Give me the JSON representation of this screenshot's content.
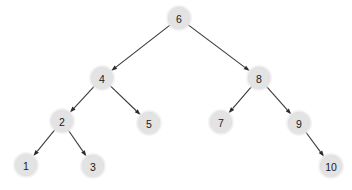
{
  "figure": {
    "type": "directed-tree-diagram",
    "width": 352,
    "height": 190,
    "background_color": "#ffffff"
  },
  "style": {
    "node_fill": "#e3e3e3",
    "node_halo": "#e8e8e8",
    "node_stroke": "#dcdcdc",
    "label_color": "#1a1a1a",
    "edge_color": "#3a3a3a",
    "arrow_color": "#2b2b2b",
    "node_radius": 11,
    "halo_radius": 13,
    "edge_width": 1.1
  },
  "nodes": [
    {
      "id": "n6",
      "label": "6",
      "x": 179,
      "y": 18,
      "level": 0
    },
    {
      "id": "n4",
      "label": "4",
      "x": 102,
      "y": 78,
      "level": 1
    },
    {
      "id": "n8",
      "label": "8",
      "x": 259,
      "y": 78,
      "level": 1
    },
    {
      "id": "n2",
      "label": "2",
      "x": 62,
      "y": 121,
      "level": 2
    },
    {
      "id": "n5",
      "label": "5",
      "x": 149,
      "y": 123,
      "level": 2
    },
    {
      "id": "n7",
      "label": "7",
      "x": 221,
      "y": 122,
      "level": 2
    },
    {
      "id": "n9",
      "label": "9",
      "x": 299,
      "y": 123,
      "level": 2
    },
    {
      "id": "n1",
      "label": "1",
      "x": 26,
      "y": 165,
      "level": 3
    },
    {
      "id": "n3",
      "label": "3",
      "x": 93,
      "y": 166,
      "level": 3
    },
    {
      "id": "n10",
      "label": "10",
      "x": 331,
      "y": 166,
      "level": 3
    }
  ],
  "edges": [
    {
      "id": "e6-4",
      "from": "n6",
      "to": "n4",
      "directed": true
    },
    {
      "id": "e6-8",
      "from": "n6",
      "to": "n8",
      "directed": true
    },
    {
      "id": "e4-2",
      "from": "n4",
      "to": "n2",
      "directed": true
    },
    {
      "id": "e4-5",
      "from": "n4",
      "to": "n5",
      "directed": true
    },
    {
      "id": "e2-1",
      "from": "n2",
      "to": "n1",
      "directed": true
    },
    {
      "id": "e2-3",
      "from": "n2",
      "to": "n3",
      "directed": true
    },
    {
      "id": "e8-7",
      "from": "n8",
      "to": "n7",
      "directed": true
    },
    {
      "id": "e8-9",
      "from": "n8",
      "to": "n9",
      "directed": true
    },
    {
      "id": "e9-10",
      "from": "n9",
      "to": "n10",
      "directed": true
    }
  ]
}
